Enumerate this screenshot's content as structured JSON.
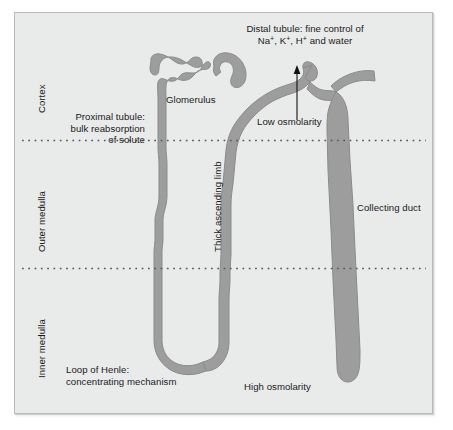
{
  "figure": {
    "background_color": "#e9eaea",
    "tubule_fill": "#9d9d9d",
    "tubule_stroke": "#8a8a8a",
    "divider_color": "#555555",
    "text_color": "#1a1a1a"
  },
  "zone_labels": [
    {
      "name": "cortex",
      "text": "Cortex"
    },
    {
      "name": "outer-medulla",
      "text": "Outer medulla"
    },
    {
      "name": "inner-medulla",
      "text": "Inner medulla"
    }
  ],
  "annotations": {
    "distal_tubule": {
      "line1": "Distal tubule: fine control of",
      "line2_pre": "Na",
      "line2_sup1": "+",
      "line2_mid1": ", K",
      "line2_sup2": "+",
      "line2_mid2": ", H",
      "line2_sup3": "+",
      "line2_post": " and water"
    },
    "glomerulus": "Glomerulus",
    "proximal_tubule": {
      "line1": "Proximal tubule:",
      "line2": "bulk reabsorption",
      "line3": "of solute"
    },
    "low_osmolarity": "Low osmolarity",
    "high_osmolarity": "High osmolarity",
    "thick_ascending_limb": "Thick ascending limb",
    "collecting_duct": "Collecting duct",
    "loop_of_henle": {
      "line1": "Loop of Henle:",
      "line2": "concentrating mechanism"
    }
  },
  "dividers": [
    {
      "name": "cortex-outer-medulla-boundary",
      "y": 140
    },
    {
      "name": "outer-inner-medulla-boundary",
      "y": 268
    }
  ]
}
